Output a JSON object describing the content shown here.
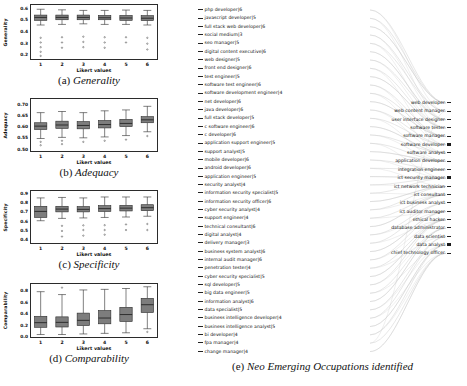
{
  "figure": {
    "panels": [
      {
        "id": "a",
        "caption_label": "(a)",
        "caption_title": "Generality",
        "xlabel": "Likert values",
        "ylabel": "Generality",
        "yticks": [
          "0.6",
          "0.5",
          "0.4",
          "0.3",
          "0.2"
        ],
        "xticks": [
          "1",
          "2",
          "3",
          "4",
          "5",
          "6"
        ]
      },
      {
        "id": "b",
        "caption_label": "(b)",
        "caption_title": "Adequacy",
        "xlabel": "Likert values",
        "ylabel": "Adequacy",
        "yticks": [
          "0.70",
          "0.65",
          "0.60",
          "0.55",
          "0.50"
        ],
        "xticks": [
          "1",
          "2",
          "3",
          "4",
          "5",
          "6"
        ]
      },
      {
        "id": "c",
        "caption_label": "(c)",
        "caption_title": "Specificity",
        "xlabel": "Likert values",
        "ylabel": "Specificity",
        "yticks": [
          "0.9",
          "0.8",
          "0.7",
          "0.6",
          "0.5",
          "0.4"
        ],
        "xticks": [
          "1",
          "2",
          "3",
          "4",
          "5",
          "6"
        ]
      },
      {
        "id": "d",
        "caption_label": "(d)",
        "caption_title": "Comparability",
        "xlabel": "Likert values",
        "ylabel": "Comparability",
        "yticks": [
          "0.8",
          "0.6",
          "0.4",
          "0.2",
          "0.0"
        ],
        "xticks": [
          "1",
          "2",
          "3",
          "4",
          "5",
          "6"
        ]
      }
    ],
    "panel_e": {
      "caption_label": "(e)",
      "caption_title": "Neo Emerging Occupations identified",
      "left_occupations": [
        "php developer|6",
        "javascript developer|5",
        "full stack web developer|6",
        "social medium|3",
        "seo manager|5",
        "digital content executive|6",
        "web designer|5",
        "front end designer|6",
        "test engineer|5",
        "software test engineer|6",
        "software development engineer|4",
        "net developer|6",
        "java developer|6",
        "full stack developer|5",
        "c software engineer|6",
        "c developer|6",
        "application support engineer|5",
        "support analyst|5",
        "mobile developer|6",
        "android developer|6",
        "application engineer|5",
        "security analyst|4",
        "information security specialist|5",
        "information security officer|6",
        "cyber security analyst|4",
        "support engineer|4",
        "technical consultant|6",
        "digital analyst|4",
        "delivery manager|3",
        "business system analyst|6",
        "internal audit manager|6",
        "penetration tester|4",
        "cyber security specialist|5",
        "sql developer|5",
        "big data engineer|5",
        "information analyst|6",
        "data specialist|5",
        "business intelligence developer|4",
        "business intelligence analyst|5",
        "bi developer|4",
        "fpa manager|4",
        "change manager|4"
      ],
      "right_occupations": [
        "web developer",
        "web content manager",
        "user interface designer",
        "software tester",
        "software manager",
        "software developer",
        "software analyst",
        "application developer",
        "integration engineer",
        "ict security manager",
        "ict network technician",
        "ict consultant",
        "ict business analyst",
        "ict auditor manager",
        "ethical hacker",
        "database administrator",
        "data scientist",
        "data analyst",
        "chief technology officer"
      ]
    }
  },
  "chart_data": [
    {
      "type": "box",
      "title": "Generality",
      "xlabel": "Likert values",
      "ylabel": "Generality",
      "categories": [
        "1",
        "2",
        "3",
        "4",
        "5",
        "6"
      ],
      "ylim": [
        0.15,
        0.63
      ],
      "yticks": [
        0.6,
        0.5,
        0.4,
        0.3,
        0.2
      ],
      "grid": false,
      "boxes": [
        {
          "category": "1",
          "whisker_low": 0.45,
          "q1": 0.49,
          "median": 0.515,
          "q3": 0.535,
          "whisker_high": 0.585,
          "outliers": [
            0.34,
            0.3,
            0.26,
            0.22,
            0.185
          ]
        },
        {
          "category": "2",
          "whisker_low": 0.455,
          "q1": 0.495,
          "median": 0.515,
          "q3": 0.535,
          "whisker_high": 0.58,
          "outliers": [
            0.345,
            0.3,
            0.255
          ]
        },
        {
          "category": "3",
          "whisker_low": 0.46,
          "q1": 0.495,
          "median": 0.515,
          "q3": 0.535,
          "whisker_high": 0.575,
          "outliers": [
            0.35,
            0.305,
            0.26
          ]
        },
        {
          "category": "4",
          "whisker_low": 0.455,
          "q1": 0.495,
          "median": 0.512,
          "q3": 0.532,
          "whisker_high": 0.575,
          "outliers": [
            0.345,
            0.3,
            0.255
          ]
        },
        {
          "category": "5",
          "whisker_low": 0.455,
          "q1": 0.49,
          "median": 0.51,
          "q3": 0.532,
          "whisker_high": 0.578,
          "outliers": [
            0.345,
            0.3
          ]
        },
        {
          "category": "6",
          "whisker_low": 0.45,
          "q1": 0.488,
          "median": 0.508,
          "q3": 0.53,
          "whisker_high": 0.575,
          "outliers": [
            0.34,
            0.29,
            0.24
          ]
        }
      ]
    },
    {
      "type": "box",
      "title": "Adequacy",
      "xlabel": "Likert values",
      "ylabel": "Adequacy",
      "categories": [
        "1",
        "2",
        "3",
        "4",
        "5",
        "6"
      ],
      "ylim": [
        0.485,
        0.725
      ],
      "yticks": [
        0.7,
        0.65,
        0.6,
        0.55,
        0.5
      ],
      "grid": false,
      "boxes": [
        {
          "category": "1",
          "whisker_low": 0.545,
          "q1": 0.585,
          "median": 0.6,
          "q3": 0.615,
          "whisker_high": 0.66,
          "outliers": [
            0.53,
            0.515
          ]
        },
        {
          "category": "2",
          "whisker_low": 0.55,
          "q1": 0.59,
          "median": 0.605,
          "q3": 0.622,
          "whisker_high": 0.665,
          "outliers": [
            0.535,
            0.52
          ]
        },
        {
          "category": "3",
          "whisker_low": 0.548,
          "q1": 0.588,
          "median": 0.603,
          "q3": 0.62,
          "whisker_high": 0.66,
          "outliers": [
            0.53
          ]
        },
        {
          "category": "4",
          "whisker_low": 0.552,
          "q1": 0.592,
          "median": 0.607,
          "q3": 0.625,
          "whisker_high": 0.668,
          "outliers": [
            0.535
          ]
        },
        {
          "category": "5",
          "whisker_low": 0.558,
          "q1": 0.598,
          "median": 0.612,
          "q3": 0.63,
          "whisker_high": 0.672,
          "outliers": [
            0.54
          ]
        },
        {
          "category": "6",
          "whisker_low": 0.575,
          "q1": 0.615,
          "median": 0.628,
          "q3": 0.642,
          "whisker_high": 0.688,
          "outliers": [
            0.556
          ]
        }
      ]
    },
    {
      "type": "box",
      "title": "Specificity",
      "xlabel": "Likert values",
      "ylabel": "Specificity",
      "categories": [
        "1",
        "2",
        "3",
        "4",
        "5",
        "6"
      ],
      "ylim": [
        0.35,
        0.93
      ],
      "yticks": [
        0.9,
        0.8,
        0.7,
        0.6,
        0.5,
        0.4
      ],
      "grid": false,
      "boxes": [
        {
          "category": "1",
          "whisker_low": 0.6,
          "q1": 0.635,
          "median": 0.7,
          "q3": 0.755,
          "whisker_high": 0.845,
          "outliers": []
        },
        {
          "category": "2",
          "whisker_low": 0.625,
          "q1": 0.695,
          "median": 0.725,
          "q3": 0.755,
          "whisker_high": 0.85,
          "outliers": [
            0.545,
            0.49,
            0.43
          ]
        },
        {
          "category": "3",
          "whisker_low": 0.63,
          "q1": 0.695,
          "median": 0.722,
          "q3": 0.752,
          "whisker_high": 0.845,
          "outliers": [
            0.55,
            0.5,
            0.44
          ]
        },
        {
          "category": "4",
          "whisker_low": 0.635,
          "q1": 0.7,
          "median": 0.73,
          "q3": 0.762,
          "whisker_high": 0.855,
          "outliers": [
            0.552,
            0.5,
            0.45
          ]
        },
        {
          "category": "5",
          "whisker_low": 0.64,
          "q1": 0.705,
          "median": 0.735,
          "q3": 0.765,
          "whisker_high": 0.855,
          "outliers": [
            0.56,
            0.5
          ]
        },
        {
          "category": "6",
          "whisker_low": 0.648,
          "q1": 0.708,
          "median": 0.74,
          "q3": 0.772,
          "whisker_high": 0.855,
          "outliers": [
            0.565,
            0.5
          ]
        }
      ]
    },
    {
      "type": "box",
      "title": "Comparability",
      "xlabel": "Likert values",
      "ylabel": "Comparability",
      "categories": [
        "1",
        "2",
        "3",
        "4",
        "5",
        "6"
      ],
      "ylim": [
        -0.03,
        0.92
      ],
      "yticks": [
        0.8,
        0.6,
        0.4,
        0.2,
        0.0
      ],
      "grid": false,
      "boxes": [
        {
          "category": "1",
          "whisker_low": 0.03,
          "q1": 0.155,
          "median": 0.235,
          "q3": 0.345,
          "whisker_high": 0.77,
          "outliers": []
        },
        {
          "category": "2",
          "whisker_low": 0.03,
          "q1": 0.16,
          "median": 0.24,
          "q3": 0.335,
          "whisker_high": 0.72,
          "outliers": [
            0.84
          ]
        },
        {
          "category": "3",
          "whisker_low": 0.04,
          "q1": 0.185,
          "median": 0.275,
          "q3": 0.4,
          "whisker_high": 0.8,
          "outliers": []
        },
        {
          "category": "4",
          "whisker_low": 0.05,
          "q1": 0.215,
          "median": 0.315,
          "q3": 0.445,
          "whisker_high": 0.81,
          "outliers": []
        },
        {
          "category": "5",
          "whisker_low": 0.06,
          "q1": 0.255,
          "median": 0.375,
          "q3": 0.5,
          "whisker_high": 0.825,
          "outliers": []
        },
        {
          "category": "6",
          "whisker_low": 0.13,
          "q1": 0.41,
          "median": 0.545,
          "q3": 0.655,
          "whisker_high": 0.855,
          "outliers": [
            0.075
          ]
        }
      ]
    }
  ]
}
